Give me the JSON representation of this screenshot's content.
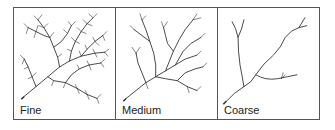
{
  "figure": {
    "panels": [
      {
        "label": "Fine",
        "density": "fine"
      },
      {
        "label": "Medium",
        "density": "medium"
      },
      {
        "label": "Coarse",
        "density": "coarse"
      }
    ],
    "colors": {
      "line": "#333333",
      "border": "#555555",
      "background": "#ffffff"
    }
  }
}
